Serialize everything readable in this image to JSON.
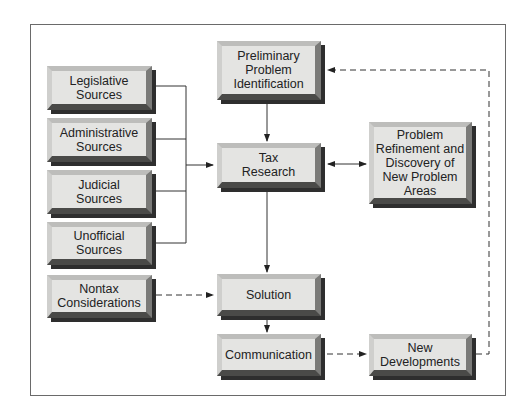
{
  "diagram": {
    "nodes": {
      "legislative": "Legislative\nSources",
      "administrative": "Administrative\nSources",
      "judicial": "Judicial\nSources",
      "unofficial": "Unofficial\nSources",
      "nontax": "Nontax\nConsiderations",
      "preliminary": "Preliminary\nProblem\nIdentification",
      "tax_research": "Tax\nResearch",
      "refinement": "Problem\nRefinement and\nDiscovery of\nNew Problem\nAreas",
      "solution": "Solution",
      "communication": "Communication",
      "new_developments": "New\nDevelopments"
    },
    "edges": [
      {
        "from": "legislative",
        "to": "tax_research",
        "style": "solid"
      },
      {
        "from": "administrative",
        "to": "tax_research",
        "style": "solid"
      },
      {
        "from": "judicial",
        "to": "tax_research",
        "style": "solid"
      },
      {
        "from": "unofficial",
        "to": "tax_research",
        "style": "solid"
      },
      {
        "from": "preliminary",
        "to": "tax_research",
        "style": "solid"
      },
      {
        "from": "tax_research",
        "to": "refinement",
        "style": "solid",
        "bidirectional": true
      },
      {
        "from": "tax_research",
        "to": "solution",
        "style": "solid"
      },
      {
        "from": "nontax",
        "to": "solution",
        "style": "dashed"
      },
      {
        "from": "solution",
        "to": "communication",
        "style": "solid"
      },
      {
        "from": "communication",
        "to": "new_developments",
        "style": "dashed"
      },
      {
        "from": "new_developments",
        "to": "preliminary",
        "style": "dashed"
      }
    ]
  }
}
